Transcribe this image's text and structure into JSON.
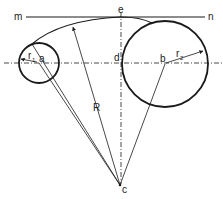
{
  "diagram": {
    "type": "geometric construction",
    "labels": {
      "m": "m",
      "n": "n",
      "e": "e",
      "d": "d",
      "a": "a",
      "b": "b",
      "c": "c",
      "R": "R",
      "r1_main": "r",
      "r1_sub": "1",
      "r2_main": "r",
      "r2_sub": "2"
    },
    "elements": {
      "tangent_line": {
        "from": "m",
        "to": "n"
      },
      "centerline_horizontal": {
        "style": "dash-dot",
        "passes_through": [
          "a",
          "d",
          "b"
        ]
      },
      "centerline_vertical": {
        "style": "dash-dot",
        "passes_through": [
          "e",
          "d",
          "c"
        ]
      },
      "small_circle": {
        "center": "a",
        "radius_label": "r1"
      },
      "large_circle": {
        "center": "b",
        "radius_label": "r2"
      },
      "arc": {
        "center": "c",
        "radius_label": "R",
        "tangent_to": "m-n at e"
      },
      "construction_lines": [
        "c-a",
        "c-b",
        "c-arc-start",
        "c-R (arrowed)"
      ]
    },
    "colors": {
      "ink": "#1a1a1a",
      "background": "#ffffff"
    }
  }
}
